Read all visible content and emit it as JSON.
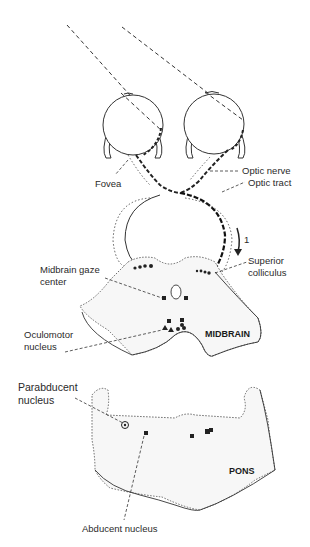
{
  "diagram": {
    "type": "anatomical-pathway",
    "labels": {
      "fovea": "Fovea",
      "optic_nerve": "Optic nerve",
      "optic_tract": "Optic tract",
      "arrow_number": "1",
      "superior_colliculus_1": "Superior",
      "superior_colliculus_2": "colliculus",
      "midbrain_gaze_1": "Midbrain gaze",
      "midbrain_gaze_2": "center",
      "oculomotor_1": "Oculomotor",
      "oculomotor_2": "nucleus",
      "midbrain": "MIDBRAIN",
      "parabducent_1": "Parabducent",
      "parabducent_2": "nucleus",
      "pons": "PONS",
      "abducent": "Abducent nucleus"
    },
    "colors": {
      "line": "#2a2a2a",
      "region_fill": "#f7f7f7",
      "background": "#ffffff"
    }
  }
}
